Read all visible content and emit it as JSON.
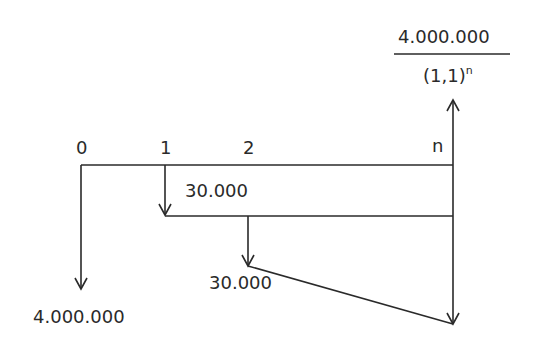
{
  "diagram": {
    "type": "cash-flow-timeline",
    "periods": [
      "0",
      "1",
      "2",
      "n"
    ],
    "outflows": [
      {
        "period": "0",
        "amount": "4.000.000"
      },
      {
        "period": "1",
        "amount": "30.000"
      },
      {
        "period": "2",
        "amount": "30.000"
      }
    ],
    "inflow": {
      "period": "n",
      "numerator": "4.000.000",
      "denominator_base": "(1,1)",
      "denominator_exponent": "n"
    },
    "line_color": "#2a2a2a"
  }
}
